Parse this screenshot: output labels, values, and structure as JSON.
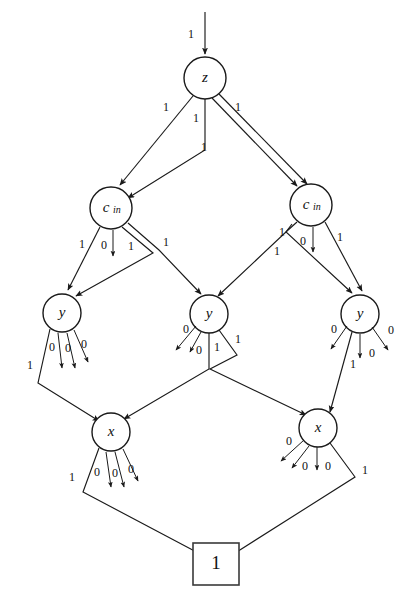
{
  "figure": {
    "type": "binary-decision-diagram",
    "title": "",
    "background_color": "#ffffff",
    "line_color": "#1a1a1a",
    "width": 419,
    "height": 600
  },
  "nodes": [
    {
      "id": "root-input",
      "kind": "input-arrow",
      "label": "",
      "cx": 205,
      "cy": 30
    },
    {
      "id": "z",
      "kind": "circle",
      "label": "z",
      "sub": "",
      "cx": 205,
      "cy": 78,
      "r": 21
    },
    {
      "id": "cin-left",
      "kind": "circle",
      "label": "c",
      "sub": "in",
      "cx": 111,
      "cy": 208,
      "r": 21
    },
    {
      "id": "cin-right",
      "kind": "circle",
      "label": "c",
      "sub": "in",
      "cx": 311,
      "cy": 205,
      "r": 21
    },
    {
      "id": "y-left",
      "kind": "circle",
      "label": "y",
      "sub": "",
      "cx": 62,
      "cy": 313,
      "r": 19
    },
    {
      "id": "y-mid",
      "kind": "circle",
      "label": "y",
      "sub": "",
      "cx": 209,
      "cy": 314,
      "r": 19
    },
    {
      "id": "y-right",
      "kind": "circle",
      "label": "y",
      "sub": "",
      "cx": 360,
      "cy": 314,
      "r": 19
    },
    {
      "id": "x-left",
      "kind": "circle",
      "label": "x",
      "sub": "",
      "cx": 111,
      "cy": 432,
      "r": 19
    },
    {
      "id": "x-right",
      "kind": "circle",
      "label": "x",
      "sub": "",
      "cx": 318,
      "cy": 428,
      "r": 19
    },
    {
      "id": "terminal-1",
      "kind": "box",
      "label": "1",
      "cx": 216,
      "cy": 564,
      "w": 46,
      "h": 42
    }
  ],
  "edge_labels": {
    "root_input": "1",
    "z_out": [
      "1",
      "1",
      "1",
      "1"
    ],
    "cin_left_out": [
      "1",
      "0",
      "1",
      "1"
    ],
    "cin_right_out": [
      "1",
      "1",
      "0",
      "1"
    ],
    "y_left_out": [
      "1",
      "0",
      "0",
      "0"
    ],
    "y_mid_out": [
      "0",
      "0",
      "1",
      "1"
    ],
    "y_right_out": [
      "0",
      "1",
      "0",
      "0"
    ],
    "x_left_out": [
      "1",
      "0",
      "0",
      "0"
    ],
    "x_right_out": [
      "0",
      "0",
      "0",
      "1"
    ]
  },
  "edges": [
    {
      "from": "input",
      "to": "z",
      "label": "1"
    },
    {
      "from": "z",
      "to": "cin-left",
      "label": "1"
    },
    {
      "from": "z",
      "to": "cin-left",
      "label": "1"
    },
    {
      "from": "z",
      "to": "cin-right",
      "label": "1"
    },
    {
      "from": "z",
      "to": "cin-right",
      "label": "1"
    },
    {
      "from": "cin-left",
      "to": "y-left",
      "label": "1"
    },
    {
      "from": "cin-left",
      "to": "sink",
      "label": "0"
    },
    {
      "from": "cin-left",
      "to": "y-left",
      "label": "1"
    },
    {
      "from": "cin-left",
      "to": "y-mid",
      "label": "1"
    },
    {
      "from": "cin-right",
      "to": "y-mid",
      "label": "1"
    },
    {
      "from": "cin-right",
      "to": "y-right",
      "label": "1"
    },
    {
      "from": "cin-right",
      "to": "sink",
      "label": "0"
    },
    {
      "from": "cin-right",
      "to": "y-right",
      "label": "1"
    },
    {
      "from": "y-left",
      "to": "x-left",
      "label": "1"
    },
    {
      "from": "y-left",
      "to": "sink",
      "label": "0"
    },
    {
      "from": "y-left",
      "to": "sink",
      "label": "0"
    },
    {
      "from": "y-left",
      "to": "sink",
      "label": "0"
    },
    {
      "from": "y-mid",
      "to": "sink",
      "label": "0"
    },
    {
      "from": "y-mid",
      "to": "sink",
      "label": "0"
    },
    {
      "from": "y-mid",
      "to": "x-left",
      "label": "1"
    },
    {
      "from": "y-mid",
      "to": "x-right",
      "label": "1"
    },
    {
      "from": "y-right",
      "to": "sink",
      "label": "0"
    },
    {
      "from": "y-right",
      "to": "x-right",
      "label": "1"
    },
    {
      "from": "y-right",
      "to": "sink",
      "label": "0"
    },
    {
      "from": "y-right",
      "to": "sink",
      "label": "0"
    },
    {
      "from": "x-left",
      "to": "terminal-1",
      "label": "1"
    },
    {
      "from": "x-left",
      "to": "sink",
      "label": "0"
    },
    {
      "from": "x-left",
      "to": "sink",
      "label": "0"
    },
    {
      "from": "x-left",
      "to": "sink",
      "label": "0"
    },
    {
      "from": "x-right",
      "to": "sink",
      "label": "0"
    },
    {
      "from": "x-right",
      "to": "sink",
      "label": "0"
    },
    {
      "from": "x-right",
      "to": "sink",
      "label": "0"
    },
    {
      "from": "x-right",
      "to": "terminal-1",
      "label": "1"
    }
  ]
}
